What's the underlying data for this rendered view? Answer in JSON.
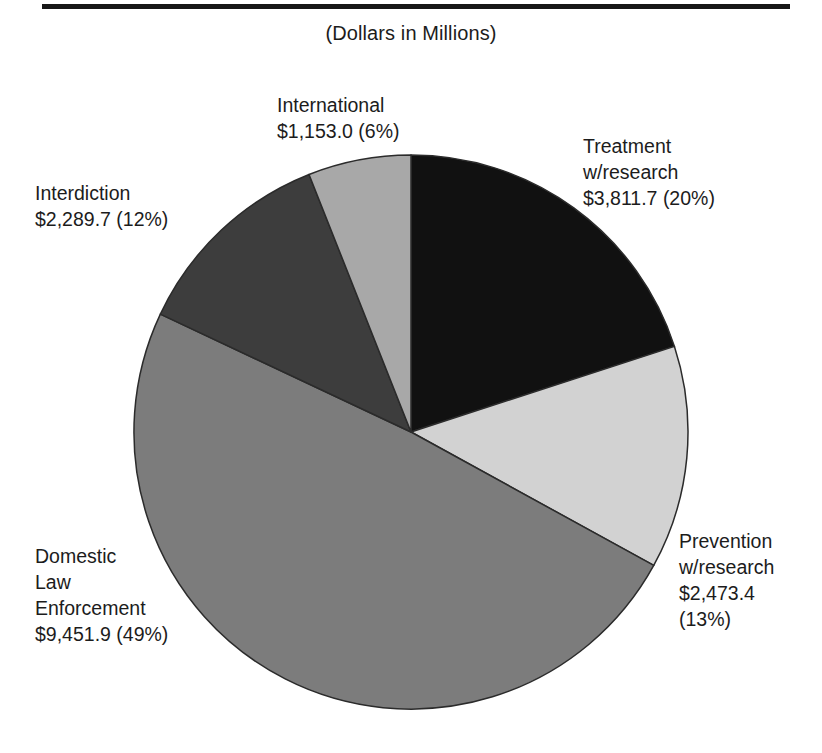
{
  "header": {
    "subtitle": "(Dollars in Millions)",
    "rule": true
  },
  "labels": {
    "international": "International\n$1,153.0 (6%)",
    "treatment": "Treatment\nw/research\n$3,811.7 (20%)",
    "interdiction": "Interdiction\n$2,289.7 (12%)",
    "prevention": "Prevention\nw/research\n$2,473.4\n(13%)",
    "domestic": "Domestic\nLaw\nEnforcement\n$9,451.9 (49%)"
  },
  "chart_data": {
    "type": "pie",
    "title": "",
    "subtitle": "(Dollars in Millions)",
    "units": "Dollars in Millions",
    "total": 19179.7,
    "start_angle_deg": 0,
    "direction": "clockwise",
    "legend": "none-labels-outside",
    "categories": [
      "Treatment w/research",
      "Prevention w/research",
      "Domestic Law Enforcement",
      "Interdiction",
      "International"
    ],
    "values": [
      3811.7,
      2473.4,
      9451.9,
      2289.7,
      1153.0
    ],
    "percentages": [
      20,
      13,
      49,
      12,
      6
    ],
    "value_labels": [
      "$3,811.7",
      "$2,473.4",
      "$9,451.9",
      "$2,289.7",
      "$1,153.0"
    ],
    "percent_labels": [
      "(20%)",
      "(13%)",
      "(49%)",
      "(12%)",
      "(6%)"
    ],
    "colors": [
      "#111111",
      "#d2d2d2",
      "#7c7c7c",
      "#3d3d3d",
      "#a8a8a8"
    ],
    "slices": [
      {
        "name": "Treatment w/research",
        "value": 3811.7,
        "percent": 20,
        "color": "#111111",
        "start_deg": 0,
        "end_deg": 72
      },
      {
        "name": "Prevention w/research",
        "value": 2473.4,
        "percent": 13,
        "color": "#d2d2d2",
        "start_deg": 72,
        "end_deg": 118.8
      },
      {
        "name": "Domestic Law Enforcement",
        "value": 9451.9,
        "percent": 49,
        "color": "#7c7c7c",
        "start_deg": 118.8,
        "end_deg": 295.2
      },
      {
        "name": "Interdiction",
        "value": 2289.7,
        "percent": 12,
        "color": "#3d3d3d",
        "start_deg": 295.2,
        "end_deg": 338.4
      },
      {
        "name": "International",
        "value": 1153.0,
        "percent": 6,
        "color": "#a8a8a8",
        "start_deg": 338.4,
        "end_deg": 360
      }
    ],
    "geometry": {
      "cx": 411,
      "cy": 432,
      "r": 277,
      "stroke": "#2b2b2b",
      "stroke_width": 1.5
    }
  }
}
